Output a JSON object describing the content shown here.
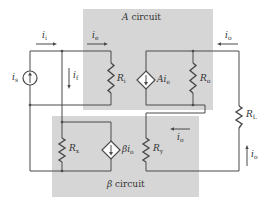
{
  "diagram": {
    "type": "feedback-amplifier-circuit",
    "colors": {
      "block_fill": "#d6d6d6",
      "wire": "#4a4a4a",
      "text": "#333333",
      "background": "#ffffff"
    },
    "blocks": [
      {
        "id": "a-circuit",
        "name_symbol": "A",
        "name_text": "circuit"
      },
      {
        "id": "beta-circuit",
        "name_symbol": "β",
        "name_text": "circuit"
      }
    ],
    "components": {
      "source": {
        "symbol": "i",
        "sub": "s",
        "kind": "independent current source"
      },
      "r_i": {
        "symbol": "R",
        "sub": "i"
      },
      "a_source": {
        "symbol": "Ai",
        "sub": "e",
        "kind": "dependent current source"
      },
      "r_o": {
        "symbol": "R",
        "sub": "o"
      },
      "r_l": {
        "symbol": "R",
        "sub": "L"
      },
      "r_x": {
        "symbol": "R",
        "sub": "x"
      },
      "beta_source": {
        "symbol": "βi",
        "sub": "o",
        "kind": "dependent current source"
      },
      "r_y": {
        "symbol": "R",
        "sub": "y"
      }
    },
    "currents": {
      "i_i": {
        "symbol": "i",
        "sub": "i",
        "direction": "right"
      },
      "i_e": {
        "symbol": "i",
        "sub": "e",
        "direction": "right"
      },
      "i_f": {
        "symbol": "i",
        "sub": "f",
        "direction": "down"
      },
      "i_o_top": {
        "symbol": "i",
        "sub": "o",
        "direction": "left"
      },
      "i_o_mid": {
        "symbol": "i",
        "sub": "o",
        "direction": "left"
      },
      "i_o_right": {
        "symbol": "i",
        "sub": "o",
        "direction": "up"
      }
    }
  }
}
